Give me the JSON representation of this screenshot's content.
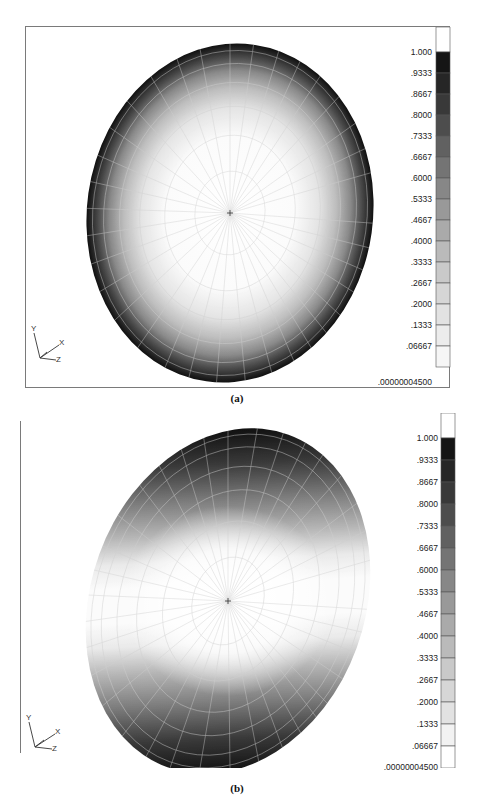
{
  "figure": {
    "panels": [
      {
        "id": "a",
        "caption": "(a)",
        "description": "Contour plot on elliptical mesh, radially symmetric (axisymmetric) distribution",
        "legend": {
          "labels": [
            "1.000",
            ".9333",
            ".8667",
            ".8000",
            ".7333",
            ".6667",
            ".6000",
            ".5333",
            ".4667",
            ".4000",
            ".3333",
            ".2667",
            ".2000",
            ".1333",
            ".06667",
            ".00000004500"
          ],
          "colors": [
            "#ffffff",
            "#151515",
            "#262626",
            "#393939",
            "#4d4d4d",
            "#616161",
            "#747474",
            "#878787",
            "#999999",
            "#aaaaaa",
            "#bababa",
            "#c9c9c9",
            "#d6d6d6",
            "#e2e2e2",
            "#ececec",
            "#f6f6f6"
          ]
        },
        "triad": {
          "x": "X",
          "y": "Y",
          "z": "Z"
        }
      },
      {
        "id": "b",
        "caption": "(b)",
        "description": "Contour plot on elliptical mesh, two-lobed distribution (top and bottom dark, band across center light)",
        "legend": {
          "labels": [
            "1.000",
            ".9333",
            ".8667",
            ".8000",
            ".7333",
            ".6667",
            ".6000",
            ".5333",
            ".4667",
            ".4000",
            ".3333",
            ".2667",
            ".2000",
            ".1333",
            ".06667",
            ".00000004500"
          ],
          "colors": [
            "#ffffff",
            "#151515",
            "#262626",
            "#393939",
            "#4d4d4d",
            "#616161",
            "#747474",
            "#878787",
            "#999999",
            "#aaaaaa",
            "#bababa",
            "#c9c9c9",
            "#d6d6d6",
            "#e2e2e2",
            "#f2f2f2",
            "#ffffff"
          ]
        },
        "triad": {
          "x": "X",
          "y": "Y",
          "z": "Z"
        }
      }
    ]
  }
}
